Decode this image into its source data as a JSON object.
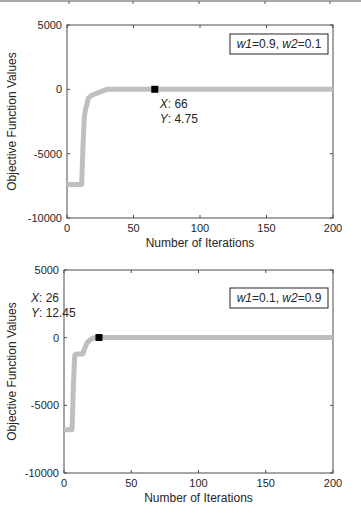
{
  "chart_data": [
    {
      "type": "line",
      "title": "",
      "legend": "w1=0.9, w2=0.1",
      "legend_parts": {
        "w1": "w1",
        "v1": "=0.9, ",
        "w2": "w2",
        "v2": "=0.1"
      },
      "xlabel": "Number of Iterations",
      "ylabel": "Objective Function Values",
      "xlim": [
        0,
        200
      ],
      "ylim": [
        -10000,
        5000
      ],
      "xticks": [
        "0",
        "50",
        "100",
        "150",
        "200"
      ],
      "yticks": [
        "5000",
        "0",
        "-5000",
        "-10000"
      ],
      "series": [
        {
          "name": "objective",
          "color": "#bfbfbf",
          "x": [
            0,
            11,
            12,
            13,
            14,
            15,
            16,
            18,
            20,
            25,
            30,
            66,
            200
          ],
          "y": [
            -7400,
            -7400,
            -4500,
            -2200,
            -1500,
            -1200,
            -700,
            -500,
            -400,
            -200,
            0,
            4.75,
            5
          ]
        }
      ],
      "datatip": {
        "x_label": "X",
        "x_value": ": 66",
        "y_label": "Y",
        "y_value": ": 4.75",
        "x": 66,
        "y": 4.75
      }
    },
    {
      "type": "line",
      "title": "",
      "legend": "w1=0.1, w2=0.9",
      "legend_parts": {
        "w1": "w1",
        "v1": "=0.1, ",
        "w2": "w2",
        "v2": "=0.9"
      },
      "xlabel": "Number of Iterations",
      "ylabel": "Objective Function Values",
      "xlim": [
        0,
        200
      ],
      "ylim": [
        -10000,
        5000
      ],
      "xticks": [
        "0",
        "50",
        "100",
        "150",
        "200"
      ],
      "yticks": [
        "5000",
        "0",
        "-5000",
        "-10000"
      ],
      "series": [
        {
          "name": "objective",
          "color": "#bfbfbf",
          "x": [
            0,
            6,
            7,
            8,
            9,
            14,
            15,
            17,
            19,
            22,
            26,
            200
          ],
          "y": [
            -6800,
            -6800,
            -3500,
            -1300,
            -1200,
            -1200,
            -900,
            -400,
            -200,
            0,
            12.45,
            12
          ]
        }
      ],
      "datatip": {
        "x_label": "X",
        "x_value": ": 26",
        "y_label": "Y",
        "y_value": ": 12.45",
        "x": 26,
        "y": 12.45
      }
    }
  ]
}
